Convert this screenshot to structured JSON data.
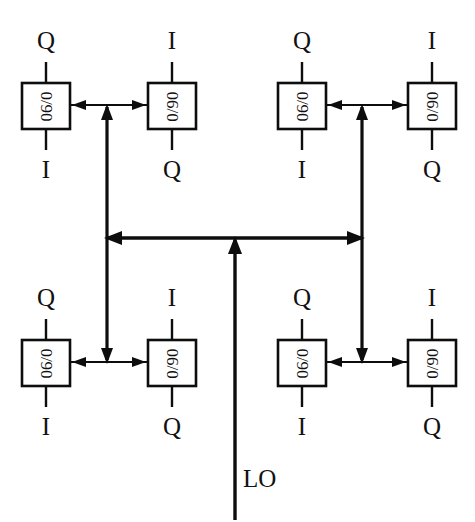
{
  "figure": {
    "background_color": "#ffffff",
    "line_color": "#0d0d0d",
    "width": 475,
    "height": 522
  },
  "source": {
    "label": "LO",
    "description": "local oscillator input at bottom center"
  },
  "blocks": [
    {
      "id": "block-top-left-left",
      "label": "0/90",
      "text_rotation": "90",
      "top_port": "Q",
      "bottom_port": "I",
      "quadrant": "top-left",
      "side": "left"
    },
    {
      "id": "block-top-left-right",
      "label": "0/90",
      "text_rotation": "-90",
      "top_port": "I",
      "bottom_port": "Q",
      "quadrant": "top-left",
      "side": "right"
    },
    {
      "id": "block-top-right-left",
      "label": "0/90",
      "text_rotation": "90",
      "top_port": "Q",
      "bottom_port": "I",
      "quadrant": "top-right",
      "side": "left"
    },
    {
      "id": "block-top-right-right",
      "label": "0/90",
      "text_rotation": "-90",
      "top_port": "I",
      "bottom_port": "Q",
      "quadrant": "top-right",
      "side": "right"
    },
    {
      "id": "block-bottom-left-left",
      "label": "0/90",
      "text_rotation": "90",
      "top_port": "Q",
      "bottom_port": "I",
      "quadrant": "bottom-left",
      "side": "left"
    },
    {
      "id": "block-bottom-left-right",
      "label": "0/90",
      "text_rotation": "-90",
      "top_port": "I",
      "bottom_port": "Q",
      "quadrant": "bottom-left",
      "side": "right"
    },
    {
      "id": "block-bottom-right-left",
      "label": "0/90",
      "text_rotation": "90",
      "top_port": "Q",
      "bottom_port": "I",
      "quadrant": "bottom-right",
      "side": "left"
    },
    {
      "id": "block-bottom-right-right",
      "label": "0/90",
      "text_rotation": "-90",
      "top_port": "I",
      "bottom_port": "Q",
      "quadrant": "bottom-right",
      "side": "right"
    }
  ],
  "port_labels": {
    "top_left_q": "Q",
    "top_left_i": "I",
    "top_left_bottom_i": "I",
    "top_left_bottom_q": "Q",
    "top_right_q": "Q",
    "top_right_i": "I",
    "top_right_bottom_i": "I",
    "top_right_bottom_q": "Q",
    "bottom_left_q": "Q",
    "bottom_left_i": "I",
    "bottom_left_bottom_i": "I",
    "bottom_left_bottom_q": "Q",
    "bottom_right_q": "Q",
    "bottom_right_i": "I",
    "bottom_right_bottom_i": "I",
    "bottom_right_bottom_q": "Q"
  },
  "nets": {
    "main_bus": "central horizontal bus splitting LO left and right",
    "left_trunk": "vertical trunk feeding top-left and bottom-left quadrants",
    "right_trunk": "vertical trunk feeding top-right and bottom-right quadrants"
  }
}
